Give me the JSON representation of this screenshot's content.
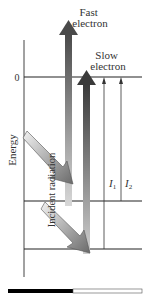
{
  "diagram": {
    "axis_label": "Energy",
    "zero_label": "0",
    "fast_electron_label_line1": "Fast",
    "fast_electron_label_line2": "electron",
    "slow_electron_label_line1": "Slow",
    "slow_electron_label_line2": "electron",
    "incident_radiation_label": "Incident radiation",
    "i1_label": "I",
    "i1_sub": "1",
    "i2_label": "I",
    "i2_sub": "2",
    "levels": [
      "0",
      "level-2",
      "level-3"
    ],
    "colors": {
      "line": "#222222",
      "arrow_dark": "#555555",
      "arrow_light": "#cccccc",
      "bar_black": "#000000"
    }
  }
}
